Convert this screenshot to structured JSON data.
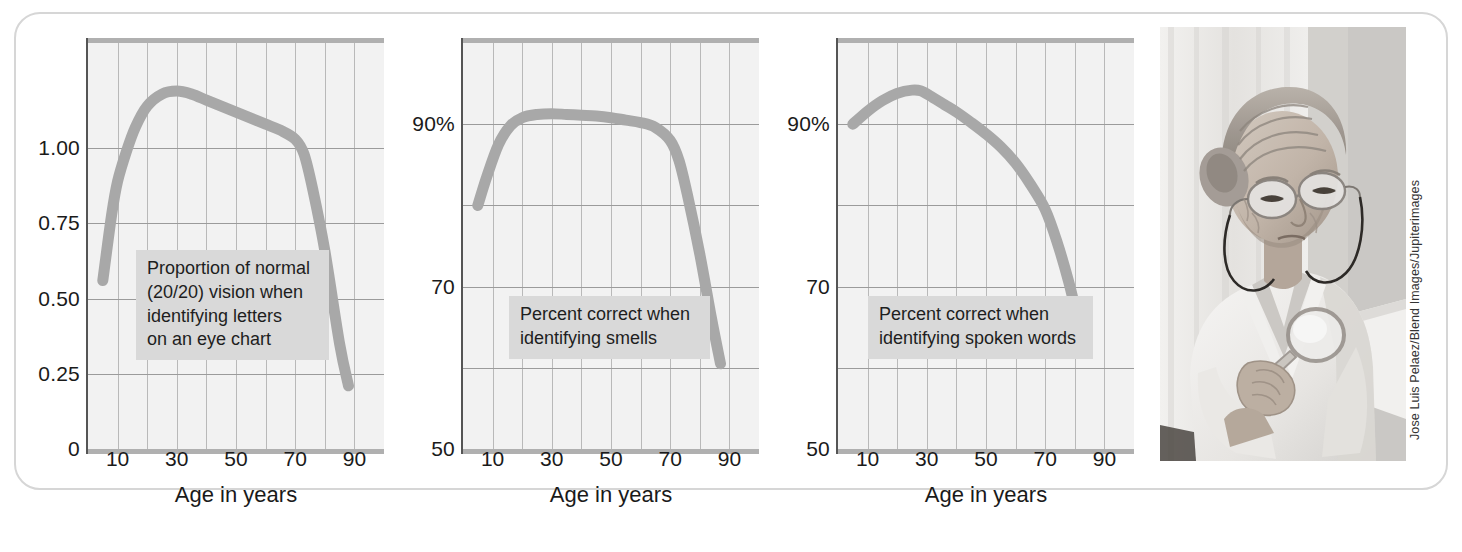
{
  "figure": {
    "photo_credit": "Jose Luis Pelaez/Blend Images/Jupiterimages",
    "photo_alt": "elderly-woman-with-magnifying-glass"
  },
  "chart_data": [
    {
      "type": "line",
      "title": "",
      "annotation": "Proportion of normal\n(20/20) vision when\nidentifying letters\non an eye chart",
      "xlabel": "Age in years",
      "ylabel": "",
      "xlim": [
        0,
        100
      ],
      "ylim": [
        0,
        1.35
      ],
      "xticks": [
        "10",
        "30",
        "50",
        "70",
        "90"
      ],
      "xtick_values": [
        10,
        30,
        50,
        70,
        90
      ],
      "yticks": [
        "1.00",
        "0.75",
        "0.50",
        "0.25",
        "0"
      ],
      "ytick_values": [
        1.0,
        0.75,
        0.5,
        0.25,
        0
      ],
      "grid": true,
      "legend": "none",
      "x": [
        5,
        8,
        10,
        13,
        16,
        20,
        25,
        30,
        35,
        40,
        45,
        50,
        55,
        60,
        65,
        70,
        73,
        76,
        80,
        85,
        88
      ],
      "values": [
        0.56,
        0.78,
        0.89,
        0.99,
        1.07,
        1.14,
        1.18,
        1.19,
        1.18,
        1.16,
        1.14,
        1.12,
        1.1,
        1.08,
        1.06,
        1.03,
        0.98,
        0.86,
        0.66,
        0.35,
        0.21
      ]
    },
    {
      "type": "line",
      "title": "",
      "annotation": "Percent correct when\nidentifying smells",
      "xlabel": "Age in years",
      "ylabel": "",
      "xlim": [
        0,
        100
      ],
      "ylim": [
        50,
        100
      ],
      "xticks": [
        "10",
        "30",
        "50",
        "70",
        "90"
      ],
      "xtick_values": [
        10,
        30,
        50,
        70,
        90
      ],
      "yticks": [
        "90%",
        "70",
        "50"
      ],
      "ytick_values": [
        90,
        70,
        50
      ],
      "gridline_values": [
        90,
        80,
        70,
        60
      ],
      "grid": true,
      "legend": "none",
      "x": [
        5,
        8,
        12,
        16,
        20,
        25,
        30,
        35,
        40,
        45,
        50,
        55,
        60,
        65,
        70,
        73,
        76,
        80,
        84,
        87
      ],
      "values": [
        80.0,
        83.5,
        87.5,
        89.8,
        90.8,
        91.2,
        91.3,
        91.2,
        91.1,
        91.0,
        90.8,
        90.5,
        90.2,
        89.6,
        88.0,
        85.5,
        81.0,
        74.0,
        66.0,
        60.5
      ]
    },
    {
      "type": "line",
      "title": "",
      "annotation": "Percent correct when\nidentifying spoken words",
      "xlabel": "Age in years",
      "ylabel": "",
      "xlim": [
        0,
        100
      ],
      "ylim": [
        50,
        100
      ],
      "xticks": [
        "10",
        "30",
        "50",
        "70",
        "90"
      ],
      "xtick_values": [
        10,
        30,
        50,
        70,
        90
      ],
      "yticks": [
        "90%",
        "70",
        "50"
      ],
      "ytick_values": [
        90,
        70,
        50
      ],
      "gridline_values": [
        90,
        80,
        70,
        60
      ],
      "grid": true,
      "legend": "none",
      "x": [
        5,
        10,
        15,
        20,
        25,
        28,
        32,
        36,
        40,
        45,
        50,
        55,
        60,
        65,
        70,
        74,
        78,
        81,
        83
      ],
      "values": [
        90.0,
        91.6,
        92.9,
        93.8,
        94.2,
        94.1,
        93.3,
        92.4,
        91.5,
        90.2,
        88.8,
        87.2,
        85.2,
        82.6,
        79.5,
        75.5,
        70.5,
        66.0,
        63.5
      ]
    }
  ]
}
